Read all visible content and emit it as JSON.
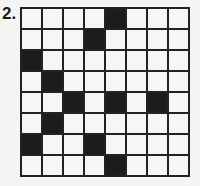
{
  "puzzle": {
    "number": "2.",
    "rows": 8,
    "cols": 8,
    "black_cells": [
      [
        0,
        4
      ],
      [
        1,
        3
      ],
      [
        2,
        0
      ],
      [
        3,
        1
      ],
      [
        4,
        2
      ],
      [
        4,
        4
      ],
      [
        4,
        6
      ],
      [
        5,
        1
      ],
      [
        6,
        0
      ],
      [
        6,
        3
      ],
      [
        7,
        4
      ]
    ],
    "colors": {
      "black": "#1c1c1c",
      "white": "#f6f6f4",
      "line": "#222222"
    }
  }
}
